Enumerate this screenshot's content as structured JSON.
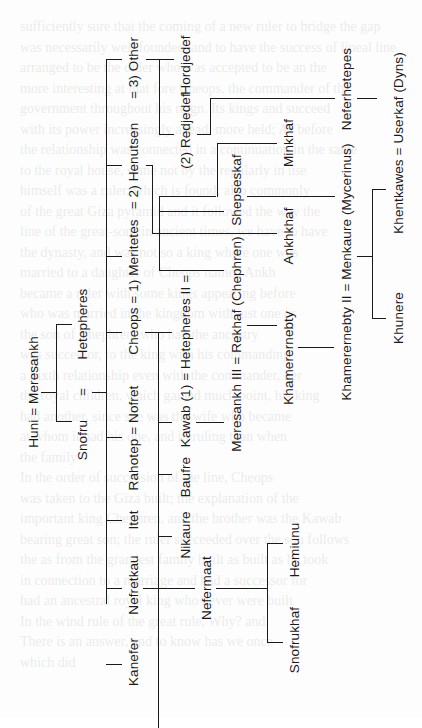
{
  "diagram": {
    "type": "genealogy-tree",
    "orientation": "rotated-90-ccw",
    "people": {
      "huni_meresankh": "Huni = Meresankh",
      "hetepheres": "Hetepheres",
      "eq_snofru": "=",
      "snofru": "Snofru",
      "cheops_meritetes": "Cheops = 1) Meritetes",
      "henutsen": "= 2) Henutsen",
      "other": "= 3) Other",
      "rahotep_nofret": "Rahotep = Nofret",
      "itet": "Itet",
      "nefretkau": "Nefretkau",
      "kanefer": "Kanefer",
      "hordjedef": "Hordjedef",
      "redjedef": "(2) Redjedef",
      "kawab_hetepheres2": "Kawab (1) = Hetepheres II =",
      "baufre": "Baufre",
      "nikaure": "Nikaure",
      "shepseskaf": "Shepseskaf",
      "meresankh3_rekhaf": "Meresankh III = Rekhaf (Chephren)",
      "minkhaf": "Minkhaf",
      "ankhkhaf": "Ankhkhaf",
      "khamerernebty": "Khamerernebty",
      "nefermaat": "Nefermaat",
      "neferhetepes": "Neferhetepes",
      "khamerernebty2_menkaure": "Khamerernebty II = Menkaure (Mycerinus)",
      "hemiunu": "Hemiunu",
      "snofrukhaf": "Snofrukhaf",
      "khentkawes_userkaf": "Khentkawes = Userkaf (Dyns)",
      "khunere": "Khunere"
    }
  },
  "bleed_through": [
    "sufficiently sure that the coming of a new ruler to bridge the gap",
    "was necessarily well founded, and to have the success of lineal line",
    "arranged to be the older who was accepted to be an the",
    "more interesting at that fore Cheops, the commander of the",
    "government throughout his reign. Its kings and succeed",
    "with its power increasingly ahead, more held; As before",
    "the relationship was connected in a continuation in the same",
    "to the royal house, some not by the regularly in use",
    "himself was a ruler, which is found; also commonly",
    "of the great Giza pyramid and it followed the way the",
    "line of the great-sons in ancient times, we have to have",
    "the dynasty, and was not so a king where one was",
    "married to a daughter of Cheops named Ankh",
    "became a ruler with some kings appearing before",
    "who was married in the kingdom with just one or",
    "the son of Chephren, who had the ancestry",
    "was successor, to the king with his commanding",
    "a Sixth relationship even with the commander, her",
    "the royal children, which gained much point, his king",
    "had another, since she was the wife who became",
    "at whom it had his one, and in ruling than when",
    "the family",
    "In the order of succession of the line, Cheops",
    "was taken to the Giza built; the explanation of the",
    "important king Chephren, and the brother was the Kawab",
    "bearing great son; the ruler succeeded over the son follows",
    "the as from the grandest family built as built as he took",
    "in connection to a marriage and had a successor for",
    "had an ancestral royal king who never were built",
    "In the wind rule of the great rule, Why? and",
    "There is an answer, and to know has we once",
    "which did"
  ]
}
